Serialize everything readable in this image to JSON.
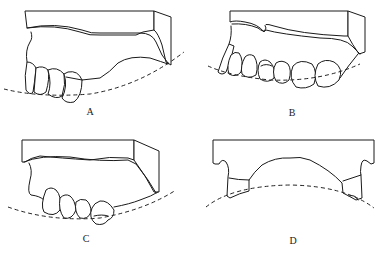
{
  "figure": {
    "panels": [
      {
        "id": "A",
        "label": "A",
        "description": "Cast with anterior teeth on left, edentulous posterior ridge, dashed occlusal curve"
      },
      {
        "id": "B",
        "label": "B",
        "description": "Cast with full arch of teeth, dashed occlusal curve"
      },
      {
        "id": "C",
        "label": "C",
        "description": "Cast with premolar/molar teeth in middle, dashed occlusal curve"
      },
      {
        "id": "D",
        "label": "D",
        "description": "Frontal view of base with teeth at both ends, convex dashed curve"
      }
    ],
    "colors": {
      "line": "#1a1a1a",
      "background": "#ffffff"
    }
  }
}
